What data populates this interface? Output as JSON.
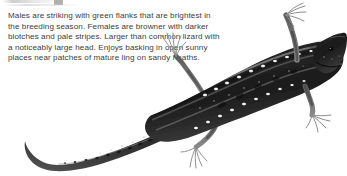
{
  "page": {
    "background_color": "#ffffff",
    "width": 347,
    "height": 176
  },
  "description": {
    "text": "Males are striking with green flanks that are brightest in the breeding season. Females are browner with darker blotches and pale stripes. Larger than common lizard with a noticeably large head. Enjoys basking in open sunny places near patches of mature ling on sandy heaths.",
    "lines": [
      "Males are striking with green flanks that are brightest in",
      "the breeding season. Females are",
      "browner with darker blotches and pale",
      "stripes. Larger than common lizard with",
      "a noticeably large head. Enjoys basking in",
      "open sunny places near patches of mature",
      "ling on sandy heaths."
    ],
    "text_color": "#3c3c3c"
  },
  "illustration": {
    "subject": "sand-lizard",
    "orientation": "head at upper right, tail curving to lower left",
    "body_color": "#2b2b2b",
    "shadow_color": "#4a4a4a",
    "marking_color": "#efefef",
    "stripe_color": "#8c8c8c",
    "limb_color": "#6b6b6b",
    "parts": [
      "head",
      "body",
      "tail",
      "front-left-leg",
      "front-right-leg",
      "hind-left-leg",
      "hind-right-leg",
      "dorsal-stripes",
      "flank-ocelli-spots"
    ]
  },
  "artifact": {
    "top_edge_smudge": "faint gray remnant of a clipped element above"
  }
}
